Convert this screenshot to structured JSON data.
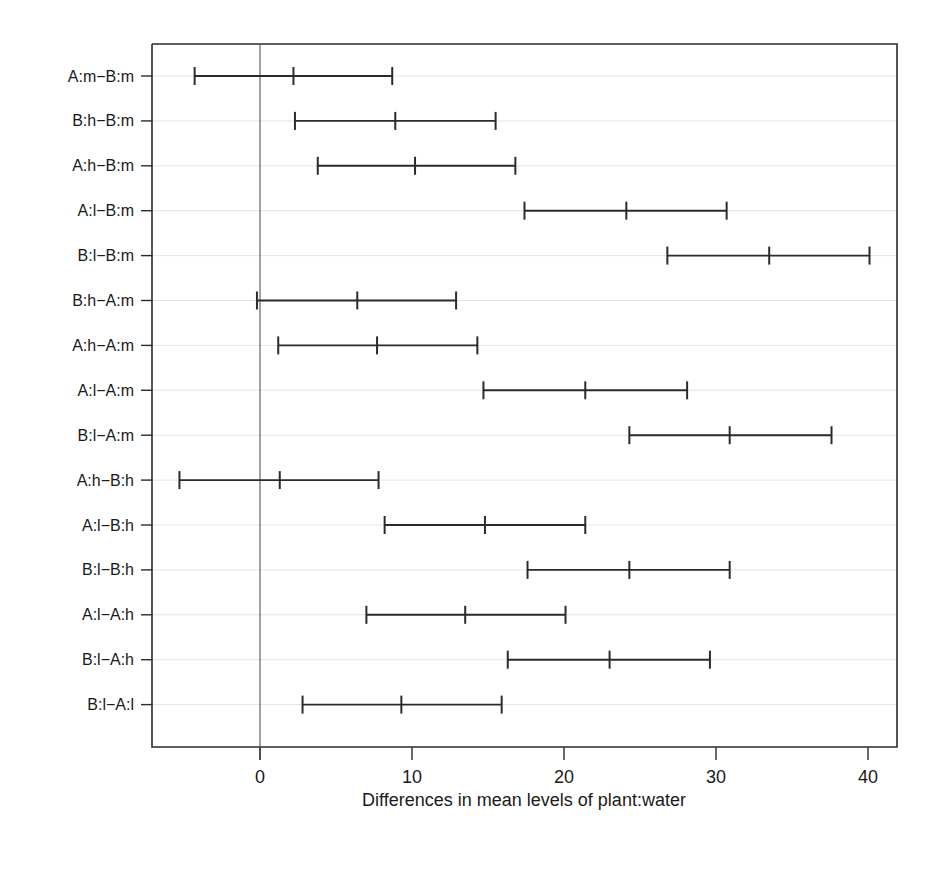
{
  "chart_data": {
    "type": "error_bar",
    "orientation": "horizontal",
    "title": "",
    "subtitle": "",
    "xlabel": "Differences in mean levels of plant:water",
    "ylabel": "",
    "xlim": [
      -8,
      42
    ],
    "xticks": [
      0,
      10,
      20,
      30,
      40
    ],
    "xticklabels": [
      "0",
      "10",
      "20",
      "30",
      "40"
    ],
    "grid": true,
    "grid_axis": "y",
    "legend": false,
    "reference_line": 0,
    "categories": [
      "A:m-B:m",
      "B:h-B:m",
      "A:h-B:m",
      "A:l-B:m",
      "B:l-B:m",
      "B:h-A:m",
      "A:h-A:m",
      "A:l-A:m",
      "B:l-A:m",
      "A:h-B:h",
      "A:l-B:h",
      "B:l-B:h",
      "A:l-A:h",
      "B:l-A:h",
      "B:l-A:l"
    ],
    "values": [
      2.2,
      8.9,
      10.2,
      24.1,
      33.5,
      6.4,
      7.7,
      21.4,
      30.9,
      1.3,
      14.8,
      24.3,
      13.5,
      23.0,
      9.3
    ],
    "lower": [
      -4.3,
      2.3,
      3.8,
      17.4,
      26.8,
      -0.2,
      1.2,
      14.7,
      24.3,
      -5.3,
      8.2,
      17.6,
      7.0,
      16.3,
      2.8
    ],
    "upper": [
      8.7,
      15.5,
      16.8,
      30.7,
      40.1,
      12.9,
      14.3,
      28.1,
      37.6,
      7.8,
      21.4,
      30.9,
      20.1,
      29.6,
      15.9
    ],
    "intervals": [
      {
        "label": "A:m-B:m",
        "lower": -4.3,
        "center": 2.2,
        "upper": 8.7
      },
      {
        "label": "B:h-B:m",
        "lower": 2.3,
        "center": 8.9,
        "upper": 15.5
      },
      {
        "label": "A:h-B:m",
        "lower": 3.8,
        "center": 10.2,
        "upper": 16.8
      },
      {
        "label": "A:l-B:m",
        "lower": 17.4,
        "center": 24.1,
        "upper": 30.7
      },
      {
        "label": "B:l-B:m",
        "lower": 26.8,
        "center": 33.5,
        "upper": 40.1
      },
      {
        "label": "B:h-A:m",
        "lower": -0.2,
        "center": 6.4,
        "upper": 12.9
      },
      {
        "label": "A:h-A:m",
        "lower": 1.2,
        "center": 7.7,
        "upper": 14.3
      },
      {
        "label": "A:l-A:m",
        "lower": 14.7,
        "center": 21.4,
        "upper": 28.1
      },
      {
        "label": "B:l-A:m",
        "lower": 24.3,
        "center": 30.9,
        "upper": 37.6
      },
      {
        "label": "A:h-B:h",
        "lower": -5.3,
        "center": 1.3,
        "upper": 7.8
      },
      {
        "label": "A:l-B:h",
        "lower": 8.2,
        "center": 14.8,
        "upper": 21.4
      },
      {
        "label": "B:l-B:h",
        "lower": 17.6,
        "center": 24.3,
        "upper": 30.9
      },
      {
        "label": "A:l-A:h",
        "lower": 7.0,
        "center": 13.5,
        "upper": 20.1
      },
      {
        "label": "B:l-A:h",
        "lower": 16.3,
        "center": 23.0,
        "upper": 29.6
      },
      {
        "label": "B:l-A:l",
        "lower": 2.8,
        "center": 9.3,
        "upper": 15.9
      }
    ]
  },
  "axis": {
    "ytick_labels": [
      "A:m−B:m",
      "B:h−B:m",
      "A:h−B:m",
      "A:l−B:m",
      "B:l−B:m",
      "B:h−A:m",
      "A:h−A:m",
      "A:l−A:m",
      "B:l−A:m",
      "A:h−B:h",
      "A:l−B:h",
      "B:l−B:h",
      "A:l−A:h",
      "B:l−A:h",
      "B:l−A:l"
    ],
    "xtick_labels": [
      "0",
      "10",
      "20",
      "30",
      "40"
    ],
    "xlabel": "Differences in mean levels of plant:water"
  },
  "colors": {
    "background": "#ffffff",
    "ink": "#2b2b2b",
    "grid": "#d8d8d8",
    "zero_line": "#555555"
  }
}
